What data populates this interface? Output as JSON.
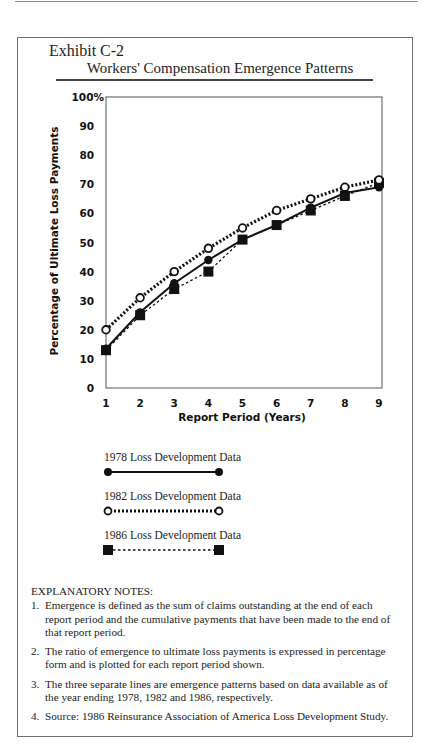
{
  "header": {
    "exhibit": "Exhibit C-2",
    "title": "Workers' Compensation Emergence Patterns"
  },
  "chart_data": {
    "type": "line",
    "title": "Workers' Compensation Emergence Patterns",
    "xlabel": "Report Period (Years)",
    "ylabel": "Percentage of Ultimate Loss Payments",
    "x": [
      1,
      2,
      3,
      4,
      5,
      6,
      7,
      8,
      9
    ],
    "x_tick_labels": [
      "1",
      "2",
      "3",
      "4",
      "5",
      "6",
      "7",
      "8",
      "9"
    ],
    "y_tick_labels": [
      "0",
      "10",
      "20",
      "30",
      "40",
      "50",
      "60",
      "70",
      "80",
      "90",
      "100%"
    ],
    "ylim": [
      0,
      100
    ],
    "xlim": [
      1,
      9
    ],
    "grid": false,
    "legend_position": "below",
    "series": [
      {
        "name": "1978 Loss Development Data",
        "marker": "filled-circle",
        "line": "solid",
        "values": [
          13.5,
          26,
          36,
          44,
          51,
          56,
          62,
          67,
          69
        ]
      },
      {
        "name": "1982 Loss Development Data",
        "marker": "open-circle",
        "line": "hatched",
        "values": [
          20,
          31,
          40,
          48,
          55,
          61,
          65,
          69,
          71.5
        ]
      },
      {
        "name": "1986 Loss Development Data",
        "marker": "filled-square",
        "line": "dotted",
        "values": [
          13,
          25,
          34,
          40,
          51,
          56,
          61,
          66,
          70.5
        ]
      }
    ]
  },
  "legend": {
    "items": [
      {
        "label": "1978 Loss Development Data"
      },
      {
        "label": "1982 Loss Development Data"
      },
      {
        "label": "1986 Loss Development Data"
      }
    ]
  },
  "notes": {
    "title": "EXPLANATORY NOTES:",
    "items": [
      {
        "num": "1.",
        "text": "Emergence is defined as the sum of claims outstanding at the end of each report period and the cumulative payments that have been made to the end of that report period."
      },
      {
        "num": "2.",
        "text": "The ratio of emergence to ultimate loss payments is expressed in percentage form and is plotted for each report period shown."
      },
      {
        "num": "3.",
        "text": "The three separate lines are emergence patterns based on data available as of the year ending 1978, 1982 and 1986, respectively."
      },
      {
        "num": "4.",
        "text": "Source: 1986 Reinsurance Association of America Loss Development Study."
      }
    ]
  }
}
